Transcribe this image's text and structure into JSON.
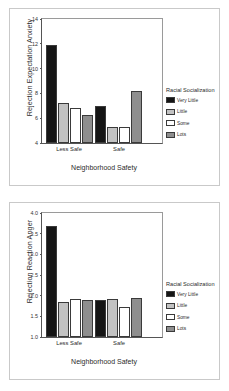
{
  "charts": [
    {
      "id": "rejection-expectation-anxiety",
      "ylabel": "Rejection Expectation Anxiety",
      "xlabel": "Neighborhood Safety",
      "legend_title": "Racial Socialization",
      "ticks": [
        "14",
        "12",
        "10",
        "8",
        "6",
        "4"
      ],
      "categories": [
        "Less Safe",
        "Safe"
      ],
      "series_names": [
        "Very Little",
        "Little",
        "Some",
        "Lots"
      ]
    },
    {
      "id": "rejection-reaction-anger",
      "ylabel": "Rejection Reaction Anger",
      "xlabel": "Neighborhood Safety",
      "legend_title": "Racial Socialization",
      "ticks": [
        "4.0",
        "3.5",
        "3.0",
        "2.5",
        "2.0",
        "1.5",
        "1.0"
      ],
      "categories": [
        "Less Safe",
        "Safe"
      ],
      "series_names": [
        "Very Little",
        "Little",
        "Some",
        "Lots"
      ]
    }
  ],
  "colors": {
    "very_little": "#151515",
    "little": "#c2c2c2",
    "some": "#ffffff",
    "lots": "#8e8e8e",
    "frame": "#c9c9c9",
    "axis": "#555555"
  },
  "chart_data": [
    {
      "type": "bar",
      "title": "",
      "xlabel": "Neighborhood Safety",
      "ylabel": "Rejection Expectation Anxiety",
      "categories": [
        "Less Safe",
        "Safe"
      ],
      "ylim": [
        4,
        14
      ],
      "yticks": [
        4,
        6,
        8,
        10,
        12,
        14
      ],
      "grid": false,
      "legend_title": "Racial Socialization",
      "legend_position": "right",
      "series": [
        {
          "name": "Very Little",
          "values": [
            11.9,
            6.95
          ]
        },
        {
          "name": "Little",
          "values": [
            7.2,
            5.3
          ]
        },
        {
          "name": "Some",
          "values": [
            6.8,
            5.3
          ]
        },
        {
          "name": "Lots",
          "values": [
            6.25,
            8.2
          ]
        }
      ]
    },
    {
      "type": "bar",
      "title": "",
      "xlabel": "Neighborhood Safety",
      "ylabel": "Rejection Reaction Anger",
      "categories": [
        "Less Safe",
        "Safe"
      ],
      "ylim": [
        1.0,
        4.0
      ],
      "yticks": [
        1.0,
        1.5,
        2.0,
        2.5,
        3.0,
        3.5,
        4.0
      ],
      "grid": false,
      "legend_title": "Racial Socialization",
      "legend_position": "right",
      "series": [
        {
          "name": "Very Little",
          "values": [
            3.68,
            1.9
          ]
        },
        {
          "name": "Little",
          "values": [
            1.85,
            1.92
          ]
        },
        {
          "name": "Some",
          "values": [
            1.93,
            1.72
          ]
        },
        {
          "name": "Lots",
          "values": [
            1.9,
            1.95
          ]
        }
      ]
    }
  ]
}
